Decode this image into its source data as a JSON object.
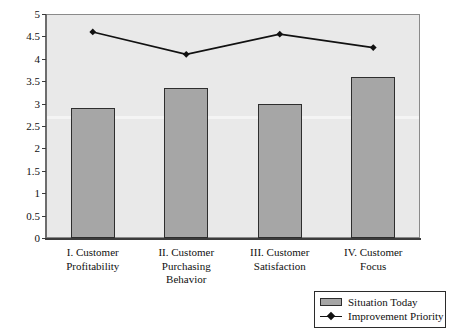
{
  "chart_data": {
    "type": "bar",
    "title": "",
    "subtitle": "",
    "xlabel": "",
    "ylabel": "",
    "ylim": [
      0,
      5
    ],
    "yticks": [
      "0",
      "0.5",
      "1",
      "1.5",
      "2",
      "2.5",
      "3",
      "3.5",
      "4",
      "4.5",
      "5"
    ],
    "ytick_values": [
      0,
      0.5,
      1,
      1.5,
      2,
      2.5,
      3,
      3.5,
      4,
      4.5,
      5
    ],
    "grid": false,
    "legend_position": "bottom-right",
    "categories": [
      "I. Customer\nProfitability",
      "II. Customer\nPurchasing\nBehavior",
      "III. Customer\nSatisfaction",
      "IV. Customer\nFocus"
    ],
    "series": [
      {
        "name": "Situation Today",
        "type": "bar",
        "color": "#a6a6a6",
        "values": [
          2.9,
          3.35,
          3.0,
          3.6
        ]
      },
      {
        "name": "Improvement Priority",
        "type": "line",
        "color": "#111111",
        "marker": "diamond",
        "values": [
          4.6,
          4.1,
          4.55,
          4.25
        ]
      }
    ]
  },
  "legend": {
    "items": [
      {
        "label": "Situation Today",
        "swatch": "bar-swatch"
      },
      {
        "label": "Improvement Priority",
        "swatch": "line-marker-swatch"
      }
    ]
  },
  "colors": {
    "bar_fill": "#a6a6a6",
    "bar_border": "#2e2e2e",
    "line": "#111111",
    "plot_background": "#e9e9e9",
    "page_background": "#ffffff"
  }
}
